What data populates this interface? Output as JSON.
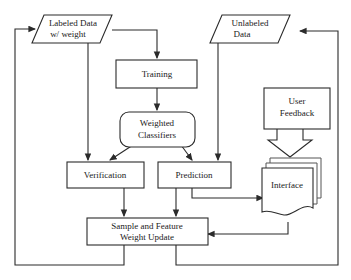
{
  "diagram": {
    "background_color": "#ffffff",
    "line_color": "#2b2b2b",
    "text_color": "#1a1a1a",
    "nodes": {
      "labeled_data": {
        "line1": "Labeled Data",
        "line2": "w/ weight",
        "shape": "parallelogram"
      },
      "unlabeled_data": {
        "line1": "Unlabeled",
        "line2": "Data",
        "shape": "parallelogram"
      },
      "training": {
        "line1": "Training",
        "shape": "rectangle"
      },
      "weighted_classifiers": {
        "line1": "Weighted",
        "line2": "Classifiers",
        "shape": "rounded-rectangle"
      },
      "verification": {
        "line1": "Verification",
        "shape": "rectangle"
      },
      "prediction": {
        "line1": "Prediction",
        "shape": "rectangle"
      },
      "user_feedback": {
        "line1": "User",
        "line2": "Feedback",
        "shape": "rectangle"
      },
      "interface": {
        "line1": "Interface",
        "shape": "stacked-document"
      },
      "sample_feature_weight_update": {
        "line1": "Sample and Feature",
        "line2": "Weight Update",
        "shape": "rectangle"
      }
    },
    "edges": [
      {
        "name": "labeled-data-to-training",
        "from": "labeled_data",
        "to": "training",
        "arrow": true
      },
      {
        "name": "labeled-data-to-verification",
        "from": "labeled_data",
        "to": "verification",
        "arrow": true
      },
      {
        "name": "training-to-weighted-classifiers",
        "from": "training",
        "to": "weighted_classifiers",
        "arrow": true
      },
      {
        "name": "weighted-classifiers-to-verification",
        "from": "weighted_classifiers",
        "to": "verification",
        "arrow": true
      },
      {
        "name": "weighted-classifiers-to-prediction",
        "from": "weighted_classifiers",
        "to": "prediction",
        "arrow": true
      },
      {
        "name": "unlabeled-data-to-prediction",
        "from": "unlabeled_data",
        "to": "prediction",
        "arrow": true
      },
      {
        "name": "verification-to-weight-update",
        "from": "verification",
        "to": "sample_feature_weight_update",
        "arrow": true
      },
      {
        "name": "prediction-to-weight-update",
        "from": "prediction",
        "to": "sample_feature_weight_update",
        "arrow": true
      },
      {
        "name": "prediction-to-interface",
        "from": "prediction",
        "to": "interface",
        "arrow": true
      },
      {
        "name": "user-feedback-to-interface",
        "from": "user_feedback",
        "to": "interface",
        "arrow": true,
        "style": "block-arrow"
      },
      {
        "name": "interface-to-weight-update",
        "from": "interface",
        "to": "sample_feature_weight_update",
        "arrow": true
      },
      {
        "name": "weight-update-to-labeled-data",
        "from": "sample_feature_weight_update",
        "to": "labeled_data",
        "arrow": true
      },
      {
        "name": "weight-update-to-unlabeled-data",
        "from": "sample_feature_weight_update",
        "to": "unlabeled_data",
        "arrow": true
      }
    ]
  }
}
